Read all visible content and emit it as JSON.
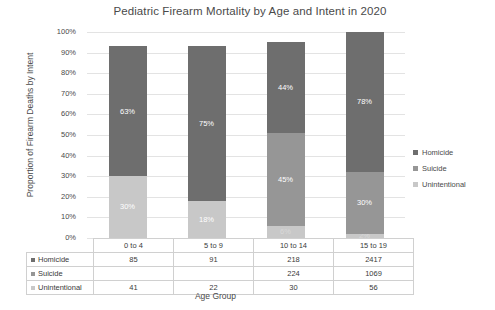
{
  "chart_data": {
    "type": "bar",
    "subtype": "stacked-100-percent",
    "title": "Pediatric Firearm Mortality by Age and Intent in 2020",
    "xlabel": "Age Group",
    "ylabel": "Proportion of Firearm Deaths by Intent",
    "categories": [
      "0 to 4",
      "5 to 9",
      "10 to 14",
      "15 to 19"
    ],
    "ylim": [
      0,
      100
    ],
    "ytick_labels": [
      "100%",
      "90%",
      "80%",
      "70%",
      "60%",
      "50%",
      "40%",
      "30%",
      "20%",
      "10%",
      "0%"
    ],
    "ytick_values": [
      100,
      90,
      80,
      70,
      60,
      50,
      40,
      30,
      20,
      10,
      0
    ],
    "grid": true,
    "legend_position": "right",
    "series": [
      {
        "name": "Homicide",
        "color": "#6e6e6e",
        "percent_labels": [
          "63%",
          "75%",
          "44%",
          "78%"
        ],
        "percent_values": [
          63,
          75,
          44,
          78
        ],
        "segment_heights": [
          63,
          75,
          44,
          68
        ],
        "counts": [
          "85",
          "91",
          "218",
          "2417"
        ]
      },
      {
        "name": "Suicide",
        "color": "#969696",
        "percent_labels": [
          "",
          "",
          "45%",
          "30%"
        ],
        "percent_values": [
          0,
          0,
          45,
          30
        ],
        "segment_heights": [
          0,
          0,
          45,
          30
        ],
        "counts": [
          "",
          "",
          "224",
          "1069"
        ]
      },
      {
        "name": "Unintentional",
        "color": "#c8c8c8",
        "percent_labels": [
          "30%",
          "18%",
          "6%",
          "2%"
        ],
        "percent_values": [
          30,
          18,
          6,
          2
        ],
        "segment_heights": [
          30,
          18,
          6,
          2
        ],
        "counts": [
          "41",
          "22",
          "30",
          "56"
        ]
      }
    ]
  },
  "legend": {
    "items": [
      {
        "label": "Homicide",
        "color": "#6e6e6e"
      },
      {
        "label": "Suicide",
        "color": "#969696"
      },
      {
        "label": "Unintentional",
        "color": "#c8c8c8"
      }
    ]
  },
  "table": {
    "column_headers": [
      "0 to 4",
      "5 to 9",
      "10 to 14",
      "15 to 19"
    ],
    "rows": [
      {
        "label": "Homicide",
        "color": "#6e6e6e",
        "values": [
          "85",
          "91",
          "218",
          "2417"
        ]
      },
      {
        "label": "Suicide",
        "color": "#969696",
        "values": [
          "",
          "",
          "224",
          "1069"
        ]
      },
      {
        "label": "Unintentional",
        "color": "#c8c8c8",
        "values": [
          "41",
          "22",
          "30",
          "56"
        ]
      }
    ]
  }
}
